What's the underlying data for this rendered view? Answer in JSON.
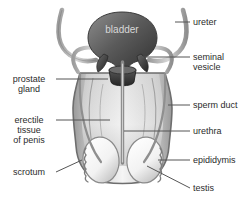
{
  "diagram": {
    "background_color": "#ffffff",
    "label_color": "#2b2b2b",
    "leader_line_color": "#555555",
    "organ_outline_color": "#6e6e6e",
    "organ_fill_light": "#f2f2f2",
    "organ_fill_mid": "#b8b8b8",
    "organ_fill_dark": "#4a4a4a"
  },
  "labels": {
    "bladder": "bladder",
    "ureter": "ureter",
    "seminal_vesicle_line1": "seminal",
    "seminal_vesicle_line2": "vesicle",
    "sperm_duct": "sperm duct",
    "urethra": "urethra",
    "epididymis": "epididymis",
    "testis": "testis",
    "prostate_line1": "prostate",
    "prostate_line2": "gland",
    "erectile_line1": "erectile",
    "erectile_line2": "tissue",
    "erectile_line3": "of penis",
    "scrotum": "scrotum"
  }
}
